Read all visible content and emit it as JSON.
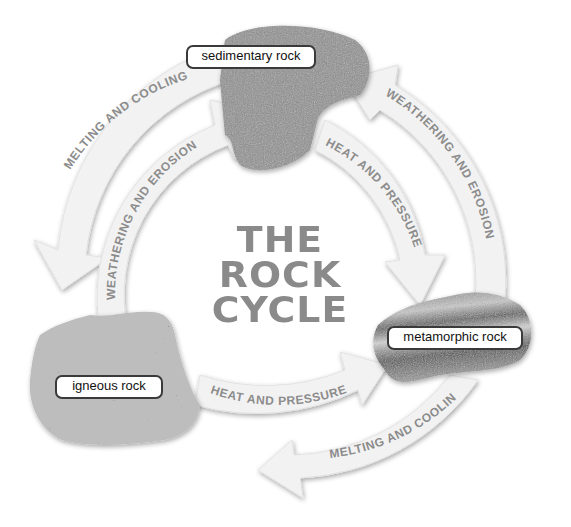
{
  "title": {
    "line1": "THE",
    "line2": "ROCK",
    "line3": "CYCLE"
  },
  "rocks": [
    {
      "id": "sedimentary",
      "label": "sedimentary rock"
    },
    {
      "id": "igneous",
      "label": "igneous rock"
    },
    {
      "id": "metamorphic",
      "label": "metamorphic rock"
    }
  ],
  "arrows": [
    {
      "id": "outer-top-left",
      "label": "MELTING AND COOLING",
      "from": "sedimentary rock",
      "to": "igneous rock"
    },
    {
      "id": "inner-left",
      "label": "WEATHERING AND EROSION",
      "from": "igneous rock",
      "to": "sedimentary rock"
    },
    {
      "id": "inner-right",
      "label": "HEAT AND PRESSURE",
      "from": "sedimentary rock",
      "to": "metamorphic rock"
    },
    {
      "id": "outer-right",
      "label": "WEATHERING AND EROSION",
      "from": "metamorphic rock",
      "to": "sedimentary rock"
    },
    {
      "id": "inner-bottom",
      "label": "HEAT AND PRESSURE",
      "from": "igneous rock",
      "to": "metamorphic rock"
    },
    {
      "id": "outer-bottom",
      "label": "MELTING AND COOLING",
      "from": "metamorphic rock",
      "to": "igneous rock"
    }
  ],
  "colors": {
    "arrow_fill": "#f1f1f1",
    "arrow_text": "#8c8c8c",
    "title": "#8a8a8a",
    "label_border": "#3a3a3a"
  }
}
